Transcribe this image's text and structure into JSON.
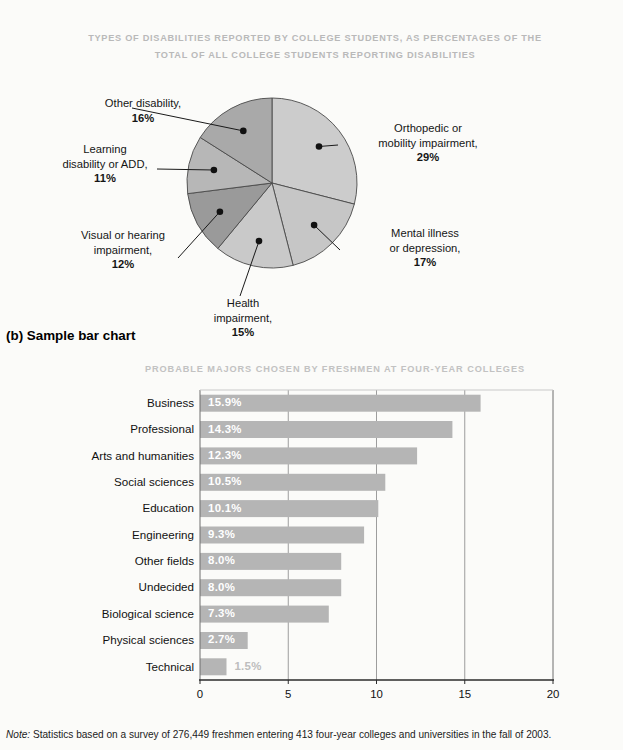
{
  "pie_section": {
    "title_line1": "TYPES OF DISABILITIES REPORTED BY COLLEGE STUDENTS, AS PERCENTAGES OF THE",
    "title_line2": "TOTAL OF ALL COLLEGE STUDENTS REPORTING DISABILITIES",
    "labels": {
      "orthopedic_l1": "Orthopedic or",
      "orthopedic_l2": "mobility impairment,",
      "orthopedic_pct": "29%",
      "mental_l1": "Mental illness",
      "mental_l2": "or depression,",
      "mental_pct": "17%",
      "health_l1": "Health",
      "health_l2": "impairment,",
      "health_pct": "15%",
      "visual_l1": "Visual or hearing",
      "visual_l2": "impairment,",
      "visual_pct": "12%",
      "learning_l1": "Learning",
      "learning_l2": "disability or ADD,",
      "learning_pct": "11%",
      "other_l1": "Other disability,",
      "other_pct": "16%"
    }
  },
  "section_b": {
    "caption": "(b) Sample bar chart",
    "title": "PROBABLE MAJORS CHOSEN BY FRESHMEN AT FOUR-YEAR COLLEGES"
  },
  "footnote": {
    "prefix": "Note:",
    "text": " Statistics based on a survey of 276,449 freshmen entering 413 four-year colleges and universities in the fall of 2003."
  },
  "chart_data": [
    {
      "type": "pie",
      "title": "TYPES OF DISABILITIES REPORTED BY COLLEGE STUDENTS, AS PERCENTAGES OF THE TOTAL OF ALL COLLEGE STUDENTS REPORTING DISABILITIES",
      "unit": "percent",
      "legend": "none",
      "start_angle_deg": 0,
      "direction": "clockwise",
      "slices": [
        {
          "label": "Orthopedic or mobility impairment",
          "value": 29,
          "display": "29%",
          "color": "#cccccc"
        },
        {
          "label": "Mental illness or depression",
          "value": 17,
          "display": "17%",
          "color": "#c6c6c6"
        },
        {
          "label": "Health impairment",
          "value": 15,
          "display": "15%",
          "color": "#c9c9c9"
        },
        {
          "label": "Visual or hearing impairment",
          "value": 12,
          "display": "12%",
          "color": "#9a9a9a"
        },
        {
          "label": "Learning disability or ADD",
          "value": 11,
          "display": "11%",
          "color": "#b7b7b7"
        },
        {
          "label": "Other disability",
          "value": 16,
          "display": "16%",
          "color": "#a9a9a9"
        }
      ]
    },
    {
      "type": "bar",
      "orientation": "horizontal",
      "title": "PROBABLE MAJORS CHOSEN BY FRESHMEN AT FOUR-YEAR COLLEGES",
      "xlabel": "",
      "ylabel": "",
      "xlim": [
        0,
        20
      ],
      "xticks": [
        "0",
        "5",
        "10",
        "15",
        "20"
      ],
      "grid": "vertical",
      "bar_color": "#b5b5b5",
      "categories": [
        "Business",
        "Professional",
        "Arts and humanities",
        "Social sciences",
        "Education",
        "Engineering",
        "Other fields",
        "Undecided",
        "Biological science",
        "Physical sciences",
        "Technical"
      ],
      "values": [
        15.9,
        14.3,
        12.3,
        10.5,
        10.1,
        9.3,
        8.0,
        8.0,
        7.3,
        2.7,
        1.5
      ],
      "value_labels": [
        "15.9%",
        "14.3%",
        "12.3%",
        "10.5%",
        "10.1%",
        "9.3%",
        "8.0%",
        "8.0%",
        "7.3%",
        "2.7%",
        "1.5%"
      ],
      "label_placement": [
        "inside",
        "inside",
        "inside",
        "inside",
        "inside",
        "inside",
        "inside",
        "inside",
        "inside",
        "inside",
        "outside"
      ]
    }
  ]
}
